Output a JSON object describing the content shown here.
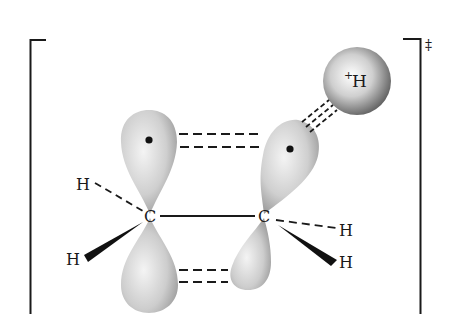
{
  "diagram": {
    "transition_state_symbol": "‡",
    "atoms": {
      "carbon_left": "C",
      "carbon_right": "C",
      "hydrogen_left_upper": "H",
      "hydrogen_left_lower": "H",
      "hydrogen_right_upper": "H",
      "hydrogen_right_lower": "H",
      "proton": "H",
      "proton_charge": "+"
    },
    "colors": {
      "lobe_light": "#f2f2f2",
      "lobe_dark": "#7a7a7a",
      "ink": "#1a1a1a",
      "background": "#ffffff"
    }
  }
}
